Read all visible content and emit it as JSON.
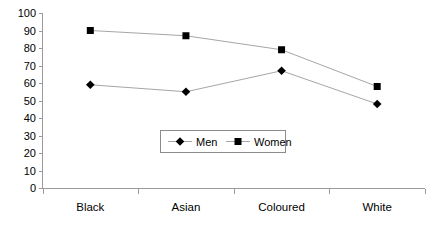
{
  "chart_data": {
    "type": "line",
    "title": "",
    "xlabel": "",
    "ylabel": "",
    "categories": [
      "Black",
      "Asian",
      "Coloured",
      "White"
    ],
    "series": [
      {
        "name": "Men",
        "marker": "diamond",
        "values": [
          59,
          55,
          67,
          48
        ]
      },
      {
        "name": "Women",
        "marker": "square",
        "values": [
          90,
          87,
          79,
          58
        ]
      }
    ],
    "ylim": [
      0,
      100
    ],
    "ytick_step": 10,
    "yticks": [
      0,
      10,
      20,
      30,
      40,
      50,
      60,
      70,
      80,
      90,
      100
    ],
    "ytick_labels": [
      "0",
      "10",
      "20",
      "30",
      "40",
      "50",
      "60",
      "70",
      "80",
      "90",
      "100"
    ],
    "grid": false,
    "legend_position": "inside-center",
    "legend_entries": [
      "Men",
      "Women"
    ],
    "colors": {
      "line": "#a6a6a6",
      "marker": "#000000",
      "axis": "#9a9a9a",
      "text": "#000000",
      "background": "#ffffff"
    }
  }
}
